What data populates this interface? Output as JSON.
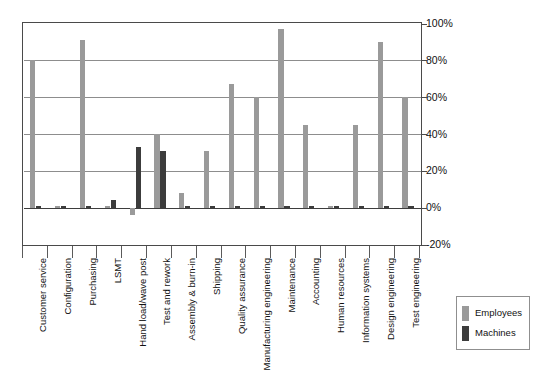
{
  "chart_data": {
    "type": "bar",
    "title": "",
    "subtitle": "",
    "xlabel": "",
    "ylabel": "",
    "ylim": [
      -20,
      100
    ],
    "ytick_labels": [
      "100%",
      "80%",
      "60%",
      "40%",
      "20%",
      "0%",
      "-20%"
    ],
    "ytick_values": [
      100,
      80,
      60,
      40,
      20,
      0,
      -20
    ],
    "grid": true,
    "legend_position": "bottom-right",
    "categories": [
      "Customer service",
      "Configuration",
      "Purchasing",
      "LSMT",
      "Hand load/wave post",
      "Test and rework",
      "Assembly & burn-in",
      "Shipping",
      "Quality assurance",
      "Manufacturing engineering",
      "Maintenance",
      "Accounting",
      "Human resources",
      "Information systems",
      "Design engineering",
      "Test engineering"
    ],
    "series": [
      {
        "name": "Employees",
        "color": "#9a9a9a",
        "values": [
          80,
          1,
          91,
          1,
          -4,
          40,
          8,
          31,
          67,
          60,
          97,
          45,
          1,
          45,
          90,
          60
        ]
      },
      {
        "name": "Machines",
        "color": "#3c3c3c",
        "values": [
          1,
          1,
          1,
          4,
          33,
          31,
          1,
          1,
          1,
          1,
          1,
          1,
          1,
          1,
          1,
          1
        ]
      }
    ]
  },
  "legend": {
    "items": [
      {
        "label": "Employees",
        "color": "#9a9a9a"
      },
      {
        "label": "Machines",
        "color": "#3c3c3c"
      }
    ]
  }
}
